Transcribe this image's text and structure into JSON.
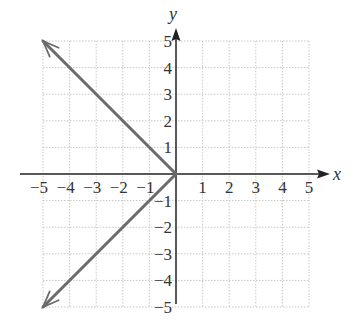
{
  "chart_data": {
    "type": "line",
    "title": "",
    "xlabel": "x",
    "ylabel": "y",
    "xlim": [
      -5,
      5
    ],
    "ylim": [
      -5,
      5
    ],
    "grid": true,
    "x_ticks": [
      "-5",
      "-4",
      "-3",
      "-2",
      "-1",
      "1",
      "2",
      "3",
      "4",
      "5"
    ],
    "y_ticks": [
      "5",
      "4",
      "3",
      "2",
      "1",
      "-1",
      "-2",
      "-3",
      "-4",
      "-5"
    ],
    "series": [
      {
        "name": "upper ray",
        "points": [
          [
            0,
            0
          ],
          [
            -5,
            5
          ]
        ],
        "arrow_at_end": true
      },
      {
        "name": "lower ray",
        "points": [
          [
            0,
            0
          ],
          [
            -5,
            -5
          ]
        ],
        "arrow_at_end": true
      }
    ],
    "colors": {
      "line": "#6b6b6b",
      "axis": "#222222",
      "grid": "#c8c8c8"
    }
  },
  "labels": {
    "x_axis": "x",
    "y_axis": "y"
  }
}
